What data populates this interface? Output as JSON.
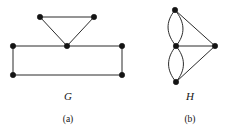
{
  "figure": {
    "type": "graph-diagram",
    "background_color": "#ffffff",
    "stroke_color": "#2b2b2b",
    "vertex_color": "#141414",
    "panels": [
      {
        "id": "panel-a",
        "graph_label": "G",
        "panel_label": "(a)",
        "vertex_count": 6,
        "vertices": [
          {
            "id": "g-top-left",
            "x": 40,
            "y": 17
          },
          {
            "id": "g-top-right",
            "x": 94,
            "y": 17
          },
          {
            "id": "g-apex",
            "x": 67,
            "y": 46
          },
          {
            "id": "g-rect-top-left",
            "x": 13,
            "y": 46
          },
          {
            "id": "g-rect-top-right",
            "x": 122,
            "y": 46
          },
          {
            "id": "g-rect-bot-left",
            "x": 13,
            "y": 75
          },
          {
            "id": "g-rect-bot-right",
            "x": 122,
            "y": 75
          }
        ],
        "edges": [
          {
            "from": "g-top-left",
            "to": "g-top-right",
            "shape": "straight"
          },
          {
            "from": "g-top-left",
            "to": "g-apex",
            "shape": "straight"
          },
          {
            "from": "g-top-right",
            "to": "g-apex",
            "shape": "straight"
          },
          {
            "from": "g-rect-top-left",
            "to": "g-apex",
            "shape": "straight"
          },
          {
            "from": "g-apex",
            "to": "g-rect-top-right",
            "shape": "straight"
          },
          {
            "from": "g-rect-top-left",
            "to": "g-rect-bot-left",
            "shape": "straight"
          },
          {
            "from": "g-rect-top-right",
            "to": "g-rect-bot-right",
            "shape": "straight"
          },
          {
            "from": "g-rect-bot-left",
            "to": "g-rect-bot-right",
            "shape": "straight"
          }
        ]
      },
      {
        "id": "panel-b",
        "graph_label": "H",
        "panel_label": "(b)",
        "vertex_count": 4,
        "vertices": [
          {
            "id": "h-top",
            "x": 175,
            "y": 10
          },
          {
            "id": "h-middle",
            "x": 176,
            "y": 46
          },
          {
            "id": "h-bottom",
            "x": 176,
            "y": 82
          },
          {
            "id": "h-right",
            "x": 215,
            "y": 46
          }
        ],
        "edges": [
          {
            "from": "h-top",
            "to": "h-middle",
            "shape": "curve-left"
          },
          {
            "from": "h-top",
            "to": "h-middle",
            "shape": "curve-right"
          },
          {
            "from": "h-middle",
            "to": "h-bottom",
            "shape": "curve-left"
          },
          {
            "from": "h-middle",
            "to": "h-bottom",
            "shape": "curve-right"
          },
          {
            "from": "h-top",
            "to": "h-right",
            "shape": "straight"
          },
          {
            "from": "h-middle",
            "to": "h-right",
            "shape": "straight"
          },
          {
            "from": "h-bottom",
            "to": "h-right",
            "shape": "straight"
          }
        ]
      }
    ]
  }
}
